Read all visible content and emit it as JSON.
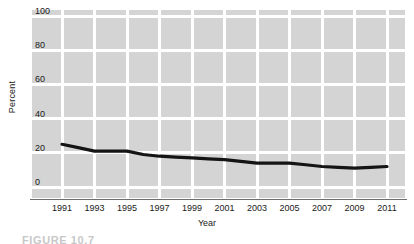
{
  "figure": {
    "caption": "FIGURE 10.7"
  },
  "chart_data": {
    "type": "line",
    "title": "",
    "xlabel": "Year",
    "ylabel": "Percent",
    "xlim": [
      1991,
      2011
    ],
    "ylim": [
      0,
      100
    ],
    "grid": true,
    "legend": null,
    "xticks": [
      "1991",
      "1993",
      "1995",
      "1997",
      "1999",
      "2001",
      "2003",
      "2005",
      "2007",
      "2009",
      "2011"
    ],
    "yticks": [
      "0",
      "20",
      "40",
      "60",
      "80",
      "100"
    ],
    "x": [
      1991,
      1992,
      1993,
      1994,
      1995,
      1996,
      1997,
      1998,
      1999,
      2000,
      2001,
      2002,
      2003,
      2004,
      2005,
      2006,
      2007,
      2008,
      2009,
      2010,
      2011
    ],
    "values": [
      25,
      23,
      21,
      21,
      21,
      19,
      18,
      17.5,
      17,
      16.5,
      16,
      15,
      14,
      14,
      14,
      13,
      12,
      11.5,
      11,
      11.5,
      12
    ],
    "series": [
      {
        "name": "Percent",
        "color": "#141414",
        "values": [
          25,
          23,
          21,
          21,
          21,
          19,
          18,
          17.5,
          17,
          16.5,
          16,
          15,
          14,
          14,
          14,
          13,
          12,
          11.5,
          11,
          11.5,
          12
        ]
      }
    ],
    "colors": {
      "plot_background": "#d4d4d4",
      "gridline": "#ffffff",
      "line": "#141414",
      "axis": "#6e6e6e",
      "text": "#1a1a1a"
    }
  }
}
